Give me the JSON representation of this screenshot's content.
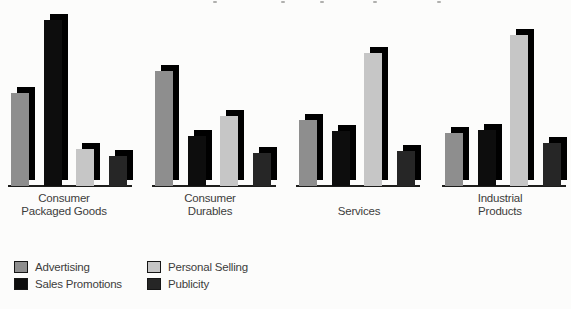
{
  "page": {
    "background": "#fcfcfb",
    "baseline_color": "#1d1d1b",
    "text_color": "#3c3c3c"
  },
  "chart_data": {
    "type": "bar",
    "title": "",
    "subtitle": "",
    "categories": [
      "Consumer Packaged Goods",
      "Consumer Durables",
      "Services",
      "Industrial Products"
    ],
    "category_label_lines": [
      [
        "Consumer",
        "Packaged Goods"
      ],
      [
        "Consumer",
        "Durables"
      ],
      [
        "Services"
      ],
      [
        "Industrial",
        "Products"
      ]
    ],
    "series": [
      {
        "name": "Advertising",
        "color": "#8e8e8e",
        "values": [
          56,
          69,
          40,
          32
        ]
      },
      {
        "name": "Sales Promotions",
        "color": "#0d0d0d",
        "values": [
          100,
          30,
          33,
          34
        ]
      },
      {
        "name": "Personal Selling",
        "color": "#c6c6c6",
        "values": [
          22,
          42,
          80,
          91
        ]
      },
      {
        "name": "Publicity",
        "color": "#262626",
        "values": [
          18,
          20,
          21,
          26
        ]
      }
    ],
    "ylim": [
      0,
      100
    ],
    "units": "relative bar height (no value axis shown in figure)",
    "grid": false,
    "value_axis_shown": false,
    "legend_position": "bottom-left, two columns",
    "effect_3d": {
      "shadow_color": "#000000",
      "offset_x_px": 6,
      "offset_y_px": 6
    },
    "layout": {
      "max_bar_height_px": 166,
      "bar_width_px": 18,
      "bar_offsets_in_group_px": [
        3,
        36,
        68,
        101
      ],
      "group_left_px": [
        8,
        152,
        296,
        442
      ],
      "label_center_px": [
        64,
        210,
        359,
        500
      ]
    }
  }
}
